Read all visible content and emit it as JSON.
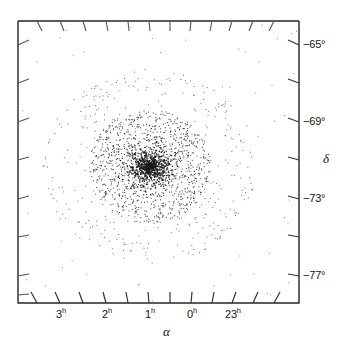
{
  "figure": {
    "name": "star-cluster-sky-map",
    "background_color": "#ffffff",
    "ink_color": "#141414",
    "point_color": "#1a1a1a"
  },
  "chart_data": {
    "type": "scatter",
    "title": "",
    "subtitle": "",
    "xlabel": "α",
    "ylabel": "δ",
    "grid": false,
    "legend": null,
    "x_axis": {
      "name": "right-ascension",
      "unit": "hours",
      "direction": "decreasing-to-the-right",
      "tick_labels": [
        "3",
        "2",
        "1",
        "0",
        "23"
      ],
      "tick_suffix": "h",
      "tick_values": [
        3,
        2,
        1,
        0,
        23
      ],
      "minor_ticks_per_interval": 1,
      "range_hours": [
        3.9,
        22.45
      ]
    },
    "y_axis": {
      "name": "declination",
      "unit": "degrees",
      "tick_labels": [
        "−65°",
        "−69°",
        "−73°",
        "−77°"
      ],
      "tick_values": [
        -65,
        -69,
        -73,
        -77
      ],
      "minor_ticks_per_interval": 1,
      "range_degrees": [
        -78.7,
        -63.7
      ]
    },
    "series": [
      {
        "name": "cluster-members",
        "marker": "point",
        "approx_count": 2400,
        "distribution": "radially-concentrated",
        "center_alpha_hours": 0.95,
        "center_delta_degrees": -71.3,
        "core_radius_degrees": 0.8,
        "halo_radius_degrees": 4.2
      }
    ]
  },
  "labels": {
    "x_ticks": [
      {
        "text": "3",
        "sup": "h",
        "x_px": 60,
        "value": 3
      },
      {
        "text": "2",
        "sup": "h",
        "x_px": 106,
        "value": 2
      },
      {
        "text": "1",
        "sup": "h",
        "x_px": 149,
        "value": 1
      },
      {
        "text": "0",
        "sup": "h",
        "x_px": 191,
        "value": 0
      },
      {
        "text": "23",
        "sup": "h",
        "x_px": 232,
        "value": 23
      }
    ],
    "y_ticks": [
      {
        "text": "−65°",
        "y_px": 45,
        "value": -65
      },
      {
        "text": "−69°",
        "y_px": 122,
        "value": -69
      },
      {
        "text": "−73°",
        "y_px": 199,
        "value": -73
      },
      {
        "text": "−77°",
        "y_px": 276,
        "value": -77
      }
    ],
    "x_axis_title": "α",
    "y_axis_title": "δ"
  },
  "frame": {
    "left_px": 18,
    "right_px": 299,
    "top_px": 21,
    "bottom_px": 303
  }
}
